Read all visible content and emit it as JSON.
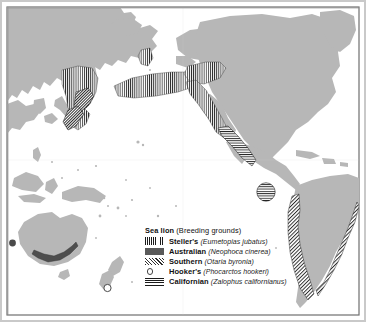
{
  "figure": {
    "kind": "distribution-map",
    "region": "Pacific Ocean",
    "frame_color": "#6f6f6f",
    "land_color": "#b7b7b7",
    "ocean_color": "#ffffff"
  },
  "legend": {
    "title_bold": "Sea lion",
    "title_rest": " (Breeding grounds)",
    "items": [
      {
        "common": "Steller's",
        "scientific": "(Eumetopias jubatus)",
        "pattern": "vertical-lines",
        "swatch_name": "swatch-vertical-lines"
      },
      {
        "common": "Australian",
        "scientific": "(Neophoca cinerea)",
        "pattern": "solid-dark",
        "swatch_name": "swatch-solid-fill"
      },
      {
        "common": "Southern",
        "scientific": "(Otaria byronia)",
        "pattern": "diagonal-hatch",
        "swatch_name": "swatch-diagonal-hatch"
      },
      {
        "common": "Hooker's",
        "scientific": "(Phocarctos hookeri)",
        "pattern": "open-circle",
        "swatch_name": "swatch-open-circle"
      },
      {
        "common": "Californian",
        "scientific": "(Zalophus californianus)",
        "pattern": "horizontal-lines",
        "swatch_name": "swatch-horizontal-lines"
      }
    ]
  },
  "map_features": {
    "landmasses": [
      "Asia (eastern Siberia, Kamchatka, Japan, China)",
      "North America (Alaska, Canada, United States, Mexico)",
      "Central America and Caribbean",
      "South America",
      "Greenland",
      "Australia",
      "New Zealand",
      "New Guinea and Indonesia",
      "Pacific islands"
    ],
    "range_patches": [
      {
        "species": "Steller's",
        "pattern": "vertical-lines",
        "areas": [
          "Sea of Okhotsk",
          "Kamchatka coast",
          "Kuril Islands",
          "Aleutian Islands",
          "Bering Sea",
          "Gulf of Alaska",
          "British Columbia to northern California"
        ]
      },
      {
        "species": "Southern",
        "pattern": "diagonal-hatch",
        "areas": [
          "Sea of Okhotsk margin",
          "Pacific coast of South America",
          "southern South America"
        ]
      },
      {
        "species": "Californian",
        "pattern": "horizontal-lines",
        "areas": [
          "California and Baja California coast",
          "Galapagos Islands"
        ]
      },
      {
        "species": "Australian",
        "pattern": "solid-dark",
        "areas": [
          "southern and south-western coast of Australia"
        ]
      },
      {
        "species": "Hooker's",
        "pattern": "open-circle",
        "areas": [
          "south of New Zealand (Auckland Islands)"
        ]
      }
    ]
  }
}
